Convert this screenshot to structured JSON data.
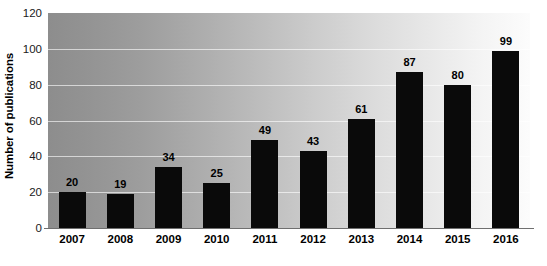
{
  "chart_data": {
    "type": "bar",
    "title": "",
    "subtitle": "",
    "xlabel": "",
    "ylabel": "Number of publications",
    "categories": [
      "2007",
      "2008",
      "2009",
      "2010",
      "2011",
      "2012",
      "2013",
      "2014",
      "2015",
      "2016"
    ],
    "values": [
      20,
      19,
      34,
      25,
      49,
      43,
      61,
      87,
      80,
      99
    ],
    "value_labels": [
      "20",
      "19",
      "34",
      "25",
      "49",
      "43",
      "61",
      "87",
      "80",
      "99"
    ],
    "ylim": [
      0,
      120
    ],
    "ytick_values": [
      0,
      20,
      40,
      60,
      80,
      100,
      120
    ],
    "ytick_labels": [
      "0",
      "20",
      "40",
      "60",
      "80",
      "100",
      "120"
    ],
    "grid": true,
    "grid_axis": "y",
    "legend": false,
    "legend_position": "none",
    "bar_color": "#0a0a0a",
    "plot_background": "horizontal gradient gray to white",
    "gridline_color": "#ffffff",
    "text_color": "#000000"
  }
}
